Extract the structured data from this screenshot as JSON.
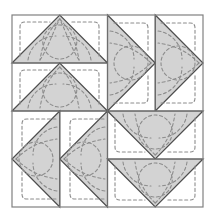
{
  "figure": {
    "width": 215,
    "height": 222,
    "background_color": "#ffffff"
  },
  "colors": {
    "patch_fill": "#d3d3d3",
    "background_fill": "#ffffff",
    "seam_line": "#4d4d4d",
    "frame_line": "#808080",
    "quilting_stitch": "#8c8c8c",
    "page_background": "#ffffff"
  },
  "frame": {
    "label": "block outer border",
    "x": 12,
    "y": 15,
    "width": 191,
    "height": 192,
    "stroke_width": 1.2
  },
  "grid": {
    "rows": 2,
    "columns": 2,
    "unit_size": 95.5,
    "center_x": 107.5,
    "center_y": 111,
    "description": "Four quadrants, each split into two half-square-triangle units"
  },
  "quadrants": [
    {
      "name": "top-left",
      "triangle_direction": "up",
      "split": "horizontal",
      "units": 2,
      "label": "two up-pointing triangles stacked"
    },
    {
      "name": "top-right",
      "triangle_direction": "right",
      "split": "vertical",
      "units": 2,
      "label": "two right-pointing triangles side by side"
    },
    {
      "name": "bottom-left",
      "triangle_direction": "left",
      "split": "vertical",
      "units": 2,
      "label": "two left-pointing triangles side by side"
    },
    {
      "name": "bottom-right",
      "triangle_direction": "down",
      "split": "horizontal",
      "units": 2,
      "label": "two down-pointing triangles stacked"
    }
  ],
  "quilting": {
    "stitch_style": "dashed",
    "dash_pattern": "3 2.6",
    "stroke_width": 1.1,
    "motifs": [
      {
        "name": "rounded-square-fill",
        "description": "rounded square outline quilted in background corners"
      },
      {
        "name": "leaf-arc",
        "description": "paired curved arcs forming leaf shapes across triangles"
      },
      {
        "name": "circle-arc",
        "description": "large circular arcs spanning seam lines"
      }
    ]
  }
}
